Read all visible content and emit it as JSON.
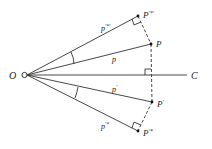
{
  "diagram": {
    "type": "geometric-construction",
    "colors": {
      "line": "#333333",
      "text": "#222222",
      "background": "#ffffff"
    },
    "points": {
      "O": {
        "label": "O",
        "x": 25,
        "y": 75
      },
      "C": {
        "label": "C",
        "x": 187,
        "y": 75
      },
      "P_prime_star_prime": {
        "label": "P",
        "sup": "′*′",
        "x": 138,
        "y": 16
      },
      "P": {
        "label": "P",
        "x": 151,
        "y": 44
      },
      "P_prime": {
        "label": "P",
        "sup": "′",
        "x": 152,
        "y": 102
      },
      "P_prime_star": {
        "label": "P",
        "sup": "′*",
        "x": 138,
        "y": 131
      }
    },
    "segment_labels": {
      "p_prime_star_prime": {
        "label": "p",
        "sup": "′*′"
      },
      "p": {
        "label": "p"
      },
      "p_prime": {
        "label": "p",
        "sup": "′"
      },
      "p_prime_star": {
        "label": "p",
        "sup": "′*"
      }
    },
    "axis_label": "C",
    "origin_label": "O"
  }
}
